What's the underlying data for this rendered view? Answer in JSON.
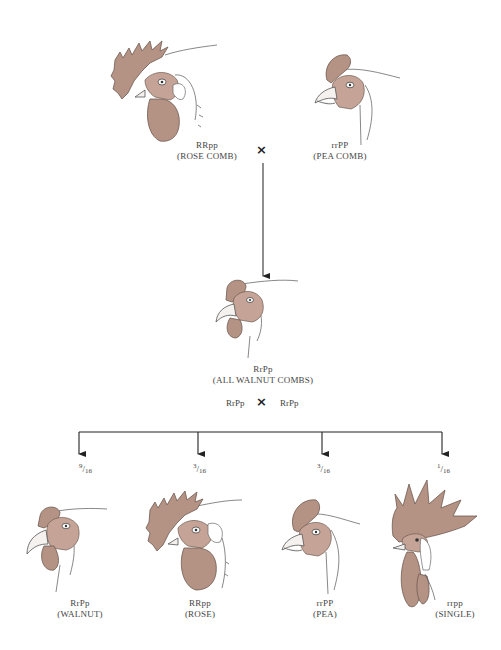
{
  "parents": {
    "rose": {
      "genotype": "RRpp",
      "phenotype": "(ROSE COMB)"
    },
    "pea": {
      "genotype": "rrPP",
      "phenotype": "(PEA COMB)"
    },
    "cross_symbol": "×"
  },
  "f1": {
    "genotype": "RrPp",
    "phenotype": "(ALL WALNUT COMBS)"
  },
  "f1_cross": {
    "left": "RrPp",
    "symbol": "×",
    "right": "RrPp"
  },
  "f2": [
    {
      "fraction_num": "9",
      "fraction_den": "16",
      "genotype": "RrPp",
      "phenotype": "(WALNUT)",
      "comb": "walnut"
    },
    {
      "fraction_num": "3",
      "fraction_den": "16",
      "genotype": "RRpp",
      "phenotype": "(ROSE)",
      "comb": "rose"
    },
    {
      "fraction_num": "3",
      "fraction_den": "16",
      "genotype": "rrPP",
      "phenotype": "(PEA)",
      "comb": "pea"
    },
    {
      "fraction_num": "1",
      "fraction_den": "16",
      "genotype": "rrpp",
      "phenotype": "(SINGLE)",
      "comb": "single"
    }
  ],
  "colors": {
    "comb": "#b49284",
    "line": "#222222",
    "text": "#444444"
  }
}
